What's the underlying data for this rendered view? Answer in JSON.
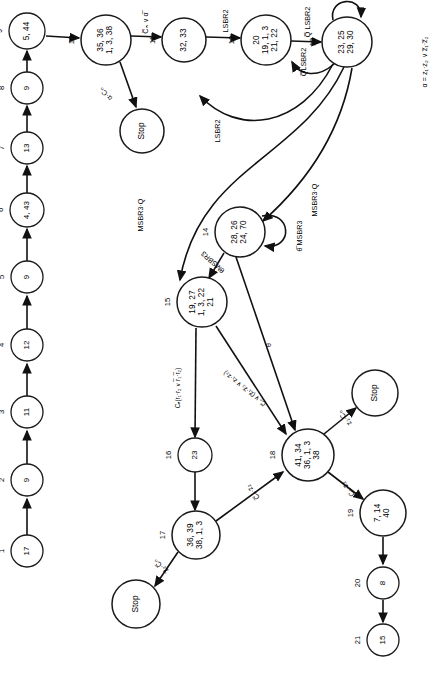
{
  "diagram": {
    "orientation": "rotated-90",
    "legend": "α = z₁·z₂ ∨ z̅₁·z̅₂",
    "stop_label": "Stop"
  },
  "states": [
    {
      "id": "1",
      "index": "1",
      "label": "17",
      "x": 27,
      "y": 551,
      "r": 16
    },
    {
      "id": "2",
      "index": "2",
      "label": "9",
      "x": 27,
      "y": 480,
      "r": 16
    },
    {
      "id": "3",
      "index": "3",
      "label": "11",
      "x": 27,
      "y": 412,
      "r": 16
    },
    {
      "id": "4",
      "index": "4",
      "label": "12",
      "x": 27,
      "y": 345,
      "r": 16
    },
    {
      "id": "5",
      "index": "5",
      "label": "9",
      "x": 27,
      "y": 277,
      "r": 16
    },
    {
      "id": "6",
      "index": "6",
      "label": "4, 43",
      "x": 27,
      "y": 210,
      "r": 17
    },
    {
      "id": "7",
      "index": "7",
      "label": "13",
      "x": 27,
      "y": 148,
      "r": 16
    },
    {
      "id": "8",
      "index": "8",
      "label": "9",
      "x": 27,
      "y": 88,
      "r": 16
    },
    {
      "id": "9",
      "index": "9",
      "label": "5, 44",
      "x": 27,
      "y": 31,
      "r": 18
    },
    {
      "id": "10",
      "index": "10",
      "label": "35, 36\n1, 3, 38",
      "x": 106,
      "y": 40,
      "r": 25
    },
    {
      "id": "11",
      "index": "11",
      "label": "32, 33",
      "x": 184,
      "y": 40,
      "r": 22
    },
    {
      "id": "12",
      "index": "12",
      "label": "20\n19, 1, 3\n21, 22",
      "x": 266,
      "y": 40,
      "r": 25
    },
    {
      "id": "13",
      "index": "13",
      "label": "23, 25\n29, 30",
      "x": 347,
      "y": 42,
      "r": 25
    },
    {
      "id": "14",
      "index": "14",
      "label": "28, 26\n24, 70",
      "x": 240,
      "y": 232,
      "r": 25
    },
    {
      "id": "15",
      "index": "15",
      "label": "19, 27\n1, 3, 22\n21",
      "x": 202,
      "y": 302,
      "r": 25
    },
    {
      "id": "16",
      "index": "16",
      "label": "23",
      "x": 195,
      "y": 455,
      "r": 17
    },
    {
      "id": "17",
      "index": "17",
      "label": "36, 39\n38, 1, 3",
      "x": 196,
      "y": 535,
      "r": 24
    },
    {
      "id": "18",
      "index": "18",
      "label": "41, 34\n36, 1, 3\n38",
      "x": 308,
      "y": 455,
      "r": 26
    },
    {
      "id": "19",
      "index": "19",
      "label": "7, 14\n40",
      "x": 383,
      "y": 513,
      "r": 23
    },
    {
      "id": "20",
      "index": "20",
      "label": "8",
      "x": 383,
      "y": 583,
      "r": 16
    },
    {
      "id": "21",
      "index": "21",
      "label": "15",
      "x": 383,
      "y": 640,
      "r": 16
    }
  ],
  "stops": [
    {
      "id": "stop-a",
      "x": 142,
      "y": 131,
      "r": 22
    },
    {
      "id": "stop-b",
      "x": 136,
      "y": 604,
      "r": 24
    },
    {
      "id": "stop-c",
      "x": 375,
      "y": 393,
      "r": 23
    }
  ],
  "edge_labels": [
    {
      "id": "alpha-cn",
      "text": "α·Cₙ",
      "x": 106,
      "y": 94,
      "rot": -45
    },
    {
      "id": "cn-or-alpha",
      "text": "C̅ₙ ∨ α̅",
      "x": 146,
      "y": 23,
      "rot": 0
    },
    {
      "id": "lsbr2-a",
      "text": "LSBR2",
      "x": 226,
      "y": 21,
      "rot": 0
    },
    {
      "id": "q-lsbr2",
      "text": "Q̅ LSBR2",
      "x": 308,
      "y": 22,
      "rot": 0
    },
    {
      "id": "q-lsbr2-loop",
      "text": "Q̅LSBR2",
      "x": 304,
      "y": 62,
      "rot": 0
    },
    {
      "id": "lsbr2-back",
      "text": "LSBR2",
      "x": 218,
      "y": 131,
      "rot": 0
    },
    {
      "id": "msbr3-q-left",
      "text": "MSBR3·Q",
      "x": 141,
      "y": 215,
      "rot": 0
    },
    {
      "id": "msbr3-q-right",
      "text": "MSBR3·Q",
      "x": 315,
      "y": 200,
      "rot": 0
    },
    {
      "id": "theta-msbr3-sl",
      "text": "θ̅ MSBR3",
      "x": 300,
      "y": 236,
      "rot": 0
    },
    {
      "id": "theta-msbr3",
      "text": "θMSBR3",
      "x": 213,
      "y": 262,
      "rot": -48
    },
    {
      "id": "theta",
      "text": "θ",
      "x": 269,
      "y": 345,
      "rot": 0
    },
    {
      "id": "cn-r1r2",
      "text": "Cₙ(r₁·r₂ ∨ r̅₁·r̅₂)",
      "x": 178,
      "y": 388,
      "rot": 0
    },
    {
      "id": "cn-or-z",
      "text": "C̅ₙ ∨ (z̅₁·z̅₂ ∨ z₁·z₂)",
      "x": 245,
      "y": 388,
      "rot": -52
    },
    {
      "id": "z2-cn-stopb",
      "text": "z̅₂·C̅ₙ",
      "x": 161,
      "y": 566,
      "rot": -48
    },
    {
      "id": "cn-z2-to18",
      "text": "C̅ₙ·z₂",
      "x": 253,
      "y": 492,
      "rot": -40
    },
    {
      "id": "z2-cn-stopc",
      "text": "z₂·Cₙ",
      "x": 345,
      "y": 418,
      "rot": -40
    },
    {
      "id": "cn-z2-to19",
      "text": "Cₙ·z₂",
      "x": 348,
      "y": 489,
      "rot": -40
    }
  ]
}
